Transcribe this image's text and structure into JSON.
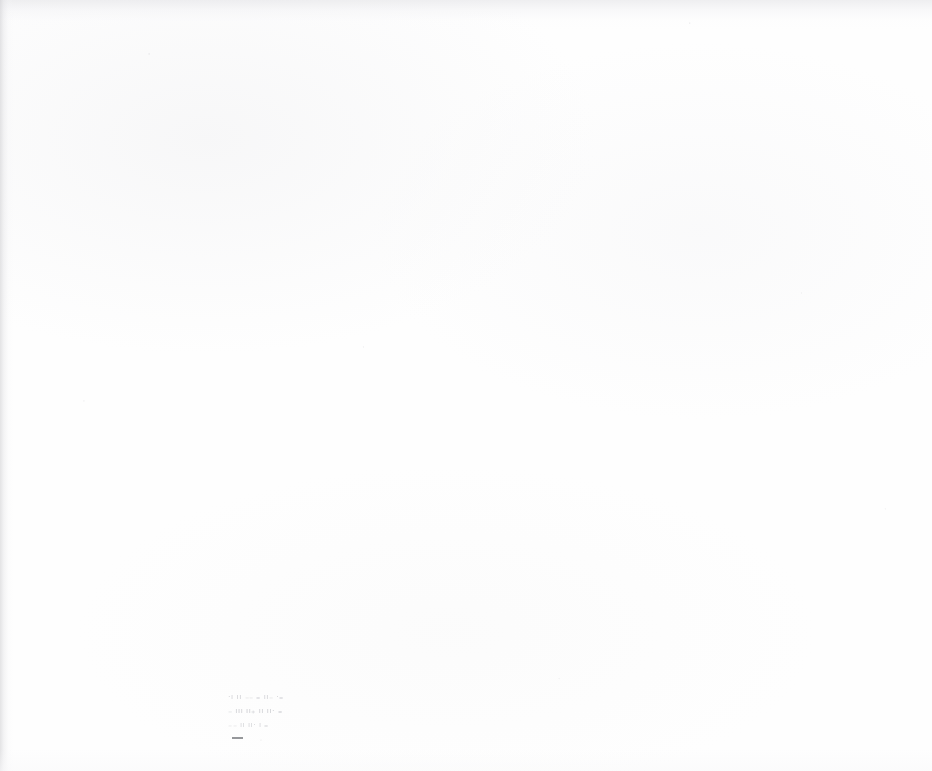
{
  "page": {
    "kind": "scanned-document-page",
    "width": 932,
    "height": 771,
    "background_color": "#fefefe",
    "content_state": "near-blank"
  },
  "artifacts": {
    "left_edge_shadow_color": "#cdcdd0",
    "top_edge_shadow_color": "#e4e4e7",
    "paper_tint_color": "#f8f8f9",
    "speckle_color": "#96969b"
  },
  "text_block": {
    "label": "faded-illegible-text",
    "legible": false,
    "line_count": 3,
    "left_px": 228,
    "top_px": 692,
    "approx_width_px": 92,
    "approx_height_px": 48,
    "ink_color": "#787a80",
    "lines": [
      {
        "index": 1,
        "transcription": "",
        "status": "illegible",
        "approx_width_px": 82,
        "top_px": 694
      },
      {
        "index": 2,
        "transcription": "",
        "status": "illegible",
        "approx_width_px": 78,
        "top_px": 708
      },
      {
        "index": 3,
        "transcription": "",
        "status": "illegible",
        "approx_width_px": 70,
        "top_px": 722
      }
    ],
    "darker_mark": {
      "label": "dash-mark",
      "color": "#56585e",
      "left_px": 233,
      "top_px": 737,
      "width_px": 11,
      "height_px": 2
    }
  },
  "render": {
    "line_1_glyphs": "·ı ıı ₋₋  ₌ ıı₋  ·₌",
    "line_2_glyphs": "₋ ııı ıı₊ ıı ıı· ₌",
    "line_3_glyphs": "₋₋ ıı ıı· ı ₌"
  }
}
